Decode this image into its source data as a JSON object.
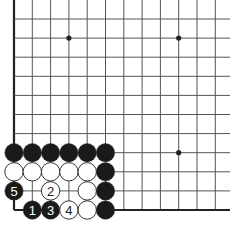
{
  "diagram": {
    "type": "go-board-problem",
    "colors": {
      "background": "#ffffff",
      "line": "#555555",
      "edge": "#222222",
      "black_stone": "#1a1a1a",
      "white_stone": "#ffffff",
      "stone_outline": "#333333"
    },
    "grid": {
      "cols": 12,
      "rows": 11,
      "x0": 14,
      "dx": 18.3,
      "y0": 19,
      "dy": 19.1,
      "left_edge": true,
      "bottom_edge": true
    },
    "star_points": [
      {
        "col": 3,
        "row": 1
      },
      {
        "col": 9,
        "row": 1
      },
      {
        "col": 9,
        "row": 7
      }
    ],
    "stones": [
      {
        "col": 0,
        "row": 7,
        "color": "black",
        "label": ""
      },
      {
        "col": 1,
        "row": 7,
        "color": "black",
        "label": ""
      },
      {
        "col": 2,
        "row": 7,
        "color": "black",
        "label": ""
      },
      {
        "col": 3,
        "row": 7,
        "color": "black",
        "label": ""
      },
      {
        "col": 4,
        "row": 7,
        "color": "black",
        "label": ""
      },
      {
        "col": 5,
        "row": 7,
        "color": "black",
        "label": ""
      },
      {
        "col": 0,
        "row": 8,
        "color": "white",
        "label": ""
      },
      {
        "col": 1,
        "row": 8,
        "color": "white",
        "label": ""
      },
      {
        "col": 2,
        "row": 8,
        "color": "white",
        "label": ""
      },
      {
        "col": 3,
        "row": 8,
        "color": "white",
        "label": ""
      },
      {
        "col": 4,
        "row": 8,
        "color": "white",
        "label": ""
      },
      {
        "col": 5,
        "row": 8,
        "color": "black",
        "label": ""
      },
      {
        "col": 0,
        "row": 9,
        "color": "black",
        "label": "5"
      },
      {
        "col": 2,
        "row": 9,
        "color": "white",
        "label": "2"
      },
      {
        "col": 4,
        "row": 9,
        "color": "white",
        "label": ""
      },
      {
        "col": 5,
        "row": 9,
        "color": "black",
        "label": ""
      },
      {
        "col": 1,
        "row": 10,
        "color": "black",
        "label": "1"
      },
      {
        "col": 2,
        "row": 10,
        "color": "black",
        "label": "3"
      },
      {
        "col": 3,
        "row": 10,
        "color": "white",
        "label": "4"
      },
      {
        "col": 4,
        "row": 10,
        "color": "white",
        "label": ""
      },
      {
        "col": 5,
        "row": 10,
        "color": "black",
        "label": ""
      }
    ]
  }
}
